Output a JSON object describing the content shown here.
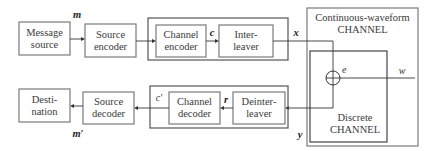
{
  "blocks": {
    "message_source": [
      "Message",
      "source"
    ],
    "source_encoder": [
      "Source",
      "encoder"
    ],
    "channel_encoder": [
      "Channel",
      "encoder"
    ],
    "interleaver": [
      "Inter-",
      "leaver"
    ],
    "destination": [
      "Desti-",
      "nation"
    ],
    "source_decoder": [
      "Source",
      "decoder"
    ],
    "channel_decoder": [
      "Channel",
      "decoder"
    ],
    "deinterleaver": [
      "Deinter-",
      "leaver"
    ]
  },
  "channels": {
    "continuous": [
      "Continuous-waveform",
      "CHANNEL"
    ],
    "discrete": [
      "Discrete",
      "CHANNEL"
    ]
  },
  "signals": {
    "m": "m",
    "c": "c",
    "x": "x",
    "e": "e",
    "w": "w",
    "y": "y",
    "r": "r",
    "c_prime": "c′",
    "m_prime": "m′"
  }
}
